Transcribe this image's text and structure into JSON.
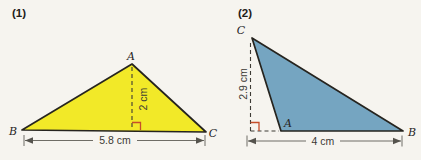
{
  "figure1": {
    "label": "(1)",
    "vertex_top": "A",
    "vertex_left": "B",
    "vertex_right": "C",
    "height_label": "2 cm",
    "base_label": "5.8 cm",
    "fill_color": "#f2e928"
  },
  "figure2": {
    "label": "(2)",
    "vertex_top": "C",
    "vertex_bottom": "A",
    "vertex_right": "B",
    "height_label": "2.9 cm",
    "base_label": "4 cm",
    "fill_color": "#75a5c1"
  },
  "colors": {
    "background": "#f6f4ef",
    "outline": "#26241f",
    "dimension_line": "#6f6d66",
    "right_angle_marker": "#c64e2a",
    "text": "#3b3934"
  }
}
